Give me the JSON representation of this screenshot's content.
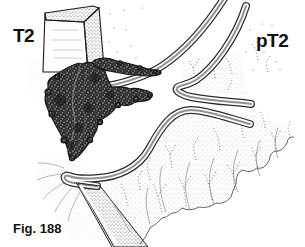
{
  "labels": {
    "left_stage": "T2",
    "right_stage": "pT2",
    "caption": "Fig. 188"
  },
  "colors": {
    "ink": "#111111",
    "background": "#ffffff",
    "tumor_fill": "#2e2e2e",
    "band_core_gray": "#909090"
  }
}
